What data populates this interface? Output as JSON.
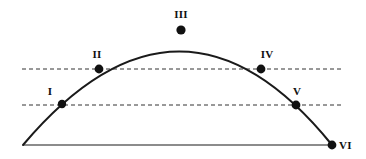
{
  "figure": {
    "kind": "projectile-trajectory-diagram",
    "width": 366,
    "height": 159,
    "background_color": "#ffffff"
  },
  "chart_data": {
    "type": "line",
    "title": "",
    "subtitle": "",
    "xlabel": "",
    "ylabel": "",
    "grid": false,
    "legend": null,
    "xlim": [
      23,
      334
    ],
    "ylim": [
      145,
      30
    ],
    "series": [
      {
        "name": "trajectory",
        "kind": "parabola",
        "color": "#1a1a1a",
        "width": 2,
        "start": {
          "x": 23,
          "y": 145
        },
        "apex": {
          "x": 181,
          "y": 30
        },
        "end": {
          "x": 332,
          "y": 145
        },
        "path": "M 23 145 Q 181 -42 332 145"
      }
    ],
    "points": [
      {
        "label": "I",
        "x": 62,
        "y": 104,
        "radius": 4.2,
        "color": "#111111",
        "label_x": 50,
        "label_y": 97,
        "label_anchor": "above"
      },
      {
        "label": "II",
        "x": 99,
        "y": 69,
        "radius": 4.4,
        "color": "#111111",
        "label_x": 97,
        "label_y": 60,
        "label_anchor": "above"
      },
      {
        "label": "III",
        "x": 181,
        "y": 30,
        "radius": 4.6,
        "color": "#111111",
        "label_x": 181,
        "label_y": 20,
        "label_anchor": "above"
      },
      {
        "label": "IV",
        "x": 261,
        "y": 69,
        "radius": 4.4,
        "color": "#111111",
        "label_x": 267,
        "label_y": 60,
        "label_anchor": "above"
      },
      {
        "label": "V",
        "x": 296,
        "y": 105,
        "radius": 4.4,
        "color": "#111111",
        "label_x": 297,
        "label_y": 97,
        "label_anchor": "above"
      },
      {
        "label": "VI",
        "x": 332,
        "y": 145,
        "radius": 4.4,
        "color": "#111111",
        "label_x": 339,
        "label_y": 145,
        "label_anchor": "right"
      }
    ],
    "reference_lines": [
      {
        "name": "upper-dashed-line",
        "orientation": "horizontal",
        "y": 69,
        "x_start": 22,
        "x_end": 343,
        "style": "dashed",
        "color": "#333333",
        "width": 1,
        "dash_pattern": "4 3",
        "intersects": [
          "II",
          "IV"
        ]
      },
      {
        "name": "lower-dashed-line",
        "orientation": "horizontal",
        "y": 105,
        "x_start": 22,
        "x_end": 343,
        "style": "dashed",
        "color": "#333333",
        "width": 1,
        "dash_pattern": "4 3",
        "intersects": [
          "I",
          "V"
        ]
      }
    ],
    "baseline": {
      "name": "ground-line",
      "orientation": "horizontal",
      "y": 145,
      "x_start": 23,
      "x_end": 334,
      "style": "solid",
      "color": "#8c8c8c",
      "width": 2
    }
  }
}
